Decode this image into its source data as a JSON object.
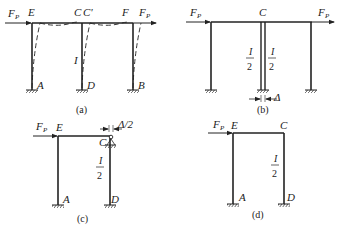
{
  "figure": {
    "panels": [
      {
        "id": "a",
        "caption": "(a)",
        "force_label": "F",
        "force_sub": "P",
        "nodes": {
          "E": "E",
          "C": "C",
          "C_prime": "C'",
          "F": "F",
          "A": "A",
          "D": "D",
          "B": "B"
        },
        "right_force_label": "F",
        "right_force_sub": "P",
        "column_inertia": "I",
        "note": "deflected shape shown dashed"
      },
      {
        "id": "b",
        "caption": "(b)",
        "force_label": "F",
        "force_sub": "P",
        "right_force_label": "F",
        "right_force_sub": "P",
        "nodes": {
          "C": "C"
        },
        "left_half_inertia_num": "I",
        "left_half_inertia_den": "2",
        "right_half_inertia_num": "I",
        "right_half_inertia_den": "2",
        "gap_label": "Δ"
      },
      {
        "id": "c",
        "caption": "(c)",
        "force_label": "F",
        "force_sub": "P",
        "nodes": {
          "E": "E",
          "C": "C",
          "A": "A",
          "D": "D"
        },
        "inertia_num": "I",
        "inertia_den": "2",
        "displacement_label": "Δ/2"
      },
      {
        "id": "d",
        "caption": "(d)",
        "force_label": "F",
        "force_sub": "P",
        "nodes": {
          "E": "E",
          "C": "C",
          "A": "A",
          "D": "D"
        },
        "inertia_num": "I",
        "inertia_den": "2"
      }
    ]
  }
}
